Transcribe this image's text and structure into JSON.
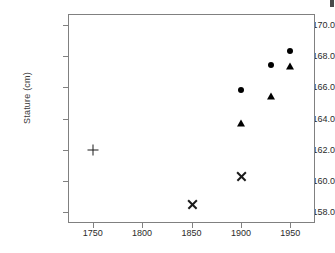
{
  "chart_data": {
    "type": "scatter",
    "title": "",
    "subtitle": "",
    "xlabel": "",
    "ylabel": "Stature (cm)",
    "xlim": [
      1725,
      1975
    ],
    "ylim": [
      157.3,
      170.7
    ],
    "grid": false,
    "legend": "none",
    "xticks": [
      1750,
      1800,
      1850,
      1900,
      1950
    ],
    "xtick_labels": [
      "1750",
      "1800",
      "1850",
      "1900",
      "1950"
    ],
    "yticks": [
      158.0,
      160.0,
      162.0,
      164.0,
      166.0,
      168.0,
      170.0
    ],
    "ytick_labels": [
      "158.0",
      "160.0",
      "162.0",
      "164.0",
      "166.0",
      "168.0",
      "170.0"
    ],
    "series": [
      {
        "name": "circle-series",
        "marker": "circle",
        "color": "#000000",
        "points": [
          {
            "x": 1900,
            "y": 165.8
          },
          {
            "x": 1930,
            "y": 167.4
          },
          {
            "x": 1950,
            "y": 168.3
          }
        ]
      },
      {
        "name": "triangle-series",
        "marker": "triangle",
        "color": "#000000",
        "points": [
          {
            "x": 1900,
            "y": 163.8
          },
          {
            "x": 1930,
            "y": 165.5
          },
          {
            "x": 1950,
            "y": 167.4
          }
        ]
      },
      {
        "name": "cross-series",
        "marker": "x",
        "color": "#1a1a1a",
        "points": [
          {
            "x": 1850,
            "y": 158.5
          },
          {
            "x": 1900,
            "y": 160.3
          }
        ]
      },
      {
        "name": "plus-series",
        "marker": "plus",
        "color": "#1a1a1a",
        "points": [
          {
            "x": 1750,
            "y": 162.0
          }
        ]
      }
    ]
  },
  "axes": {
    "y_title": "Stature (cm)"
  }
}
